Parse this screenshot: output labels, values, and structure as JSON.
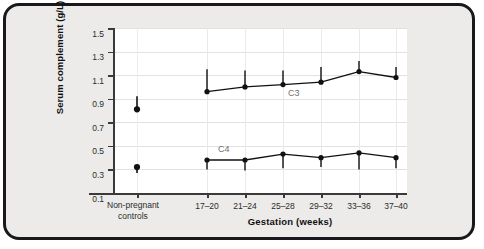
{
  "figure": {
    "background_color": "#ecebe9",
    "plot_background_color": "#ffffff",
    "border_color": "#17191c",
    "marker_color": "#111111"
  },
  "chart_data": {
    "type": "line",
    "title": "",
    "xlabel": "Gestation (weeks)",
    "ylabel": "Serum complement (g/L)",
    "ylim": [
      0.1,
      1.5
    ],
    "yticks": [
      "1.5",
      "1.3",
      "1.1",
      "0.9",
      "0.7",
      "0.5",
      "0.3",
      "0.1"
    ],
    "ytick_values": [
      1.5,
      1.3,
      1.1,
      0.9,
      0.7,
      0.5,
      0.3,
      0.1
    ],
    "grid": true,
    "legend": "inline-labels",
    "control_group_label_line1": "Non-pregnant",
    "control_group_label_line2": "controls",
    "categories": [
      "17–20",
      "21–24",
      "25–28",
      "29–32",
      "33–36",
      "37–40"
    ],
    "series": [
      {
        "name": "C3",
        "label": "C3",
        "control_value": 0.81,
        "control_error_high": 0.92,
        "control_error_low": 0.81,
        "values": [
          0.96,
          1.0,
          1.02,
          1.04,
          1.13,
          1.08
        ],
        "error_high": [
          1.15,
          1.14,
          1.14,
          1.17,
          1.22,
          1.17
        ],
        "error_low": [
          0.96,
          1.0,
          1.02,
          1.04,
          1.13,
          1.08
        ]
      },
      {
        "name": "C4",
        "label": "C4",
        "control_value": 0.32,
        "control_error_high": 0.32,
        "control_error_low": 0.27,
        "values": [
          0.38,
          0.38,
          0.43,
          0.4,
          0.44,
          0.4
        ],
        "error_high": [
          0.38,
          0.38,
          0.43,
          0.4,
          0.44,
          0.4
        ],
        "error_low": [
          0.3,
          0.29,
          0.31,
          0.32,
          0.3,
          0.31
        ]
      }
    ]
  }
}
